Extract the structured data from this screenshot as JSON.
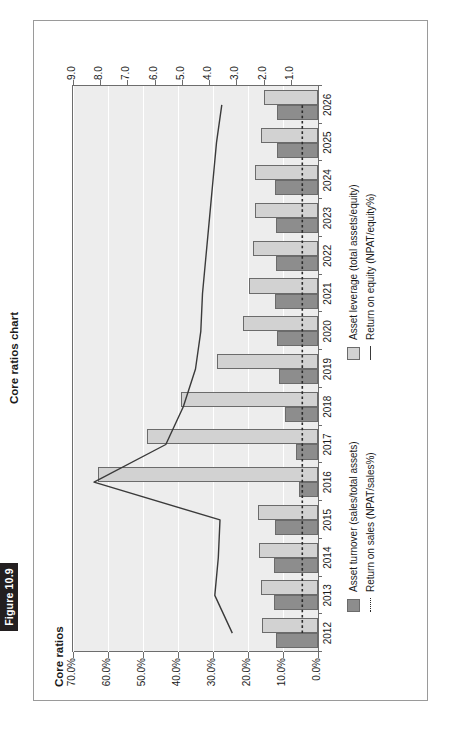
{
  "figure": {
    "number_label": "Figure 10.9",
    "caption": "Core ratios chart"
  },
  "chart_data": {
    "type": "bar",
    "title": "Core ratios",
    "orientation": "rotated-90",
    "xlabel": "",
    "ylabel": "",
    "grid": true,
    "legend_position": "bottom",
    "categories": [
      "2012",
      "2013",
      "2014",
      "2015",
      "2016",
      "2017",
      "2018",
      "2019",
      "2020",
      "2021",
      "2022",
      "2023",
      "2024",
      "2025",
      "2026"
    ],
    "percent_axis": {
      "name": "Percent axis",
      "ticks": [
        "0.0%",
        "10.0%",
        "20.0%",
        "30.0%",
        "40.0%",
        "50.0%",
        "60.0%",
        "70.0%"
      ],
      "values": [
        0,
        10,
        20,
        30,
        40,
        50,
        60,
        70
      ],
      "min": 0,
      "max": 70
    },
    "ratio_axis": {
      "name": "Ratio axis",
      "ticks": [
        "1.0",
        "2.0",
        "3.0",
        "4.0",
        "5.0",
        "6.0",
        "7.0",
        "8.0",
        "9.0"
      ],
      "values": [
        1,
        2,
        3,
        4,
        5,
        6,
        7,
        8,
        9
      ],
      "min": 0,
      "max": 9
    },
    "series": [
      {
        "name": "Asset turnover (sales/total assets)",
        "key": "asset_turnover",
        "kind": "bar",
        "axis": "ratio",
        "color": "#8d8d8d",
        "values": [
          1.55,
          1.6,
          1.62,
          1.58,
          0.68,
          0.8,
          1.2,
          1.42,
          1.52,
          1.58,
          1.56,
          1.55,
          1.58,
          1.52,
          1.5
        ]
      },
      {
        "name": "Asset leverage (total assets/equity)",
        "key": "asset_leverage",
        "kind": "bar",
        "axis": "ratio",
        "color": "#d2d2d2",
        "values": [
          2.05,
          2.1,
          2.15,
          2.2,
          8.1,
          6.3,
          5.05,
          3.7,
          2.75,
          2.55,
          2.4,
          2.3,
          2.3,
          2.1,
          2.0
        ]
      },
      {
        "name": "Return on sales (NPAT/sales%)",
        "key": "return_on_sales",
        "kind": "line",
        "style": "dotted",
        "axis": "percent",
        "color": "#2b2b2b",
        "values": [
          4.5,
          4.5,
          4.5,
          4.5,
          4.5,
          4.5,
          4.5,
          4.5,
          4.5,
          4.5,
          4.5,
          4.5,
          4.5,
          4.5,
          4.5
        ]
      },
      {
        "name": "Return on equity (NPAT/equity%)",
        "key": "return_on_equity",
        "kind": "line",
        "style": "solid",
        "axis": "percent",
        "color": "#3a3a3a",
        "values": [
          24.5,
          29.5,
          28.5,
          28.0,
          64.0,
          43.5,
          38.5,
          35.0,
          33.5,
          33.0,
          32.0,
          31.0,
          30.0,
          29.0,
          27.5
        ]
      }
    ]
  }
}
